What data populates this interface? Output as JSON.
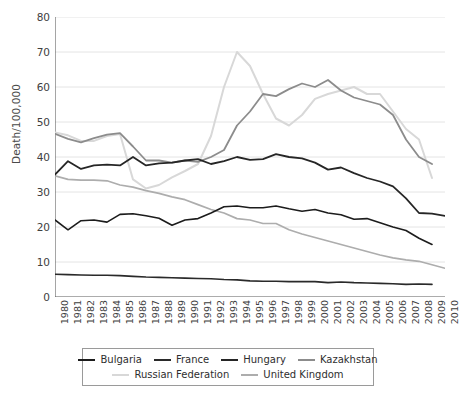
{
  "chart_data": {
    "type": "line",
    "title": "",
    "xlabel": "",
    "ylabel": "Death/100,000",
    "ylim": [
      0,
      80
    ],
    "ytick_step": 10,
    "grid": true,
    "legend_position": "bottom",
    "yticks": [
      "0",
      "10",
      "20",
      "30",
      "40",
      "50",
      "60",
      "70",
      "80"
    ],
    "x": [
      "1980",
      "1981",
      "1982",
      "1983",
      "1984",
      "1985",
      "1986",
      "1987",
      "1988",
      "1989",
      "1990",
      "1991",
      "1992",
      "1993",
      "1994",
      "1995",
      "1996",
      "1997",
      "1998",
      "1999",
      "2000",
      "2001",
      "2002",
      "2003",
      "2004",
      "2005",
      "2006",
      "2007",
      "2008",
      "2009",
      "2010"
    ],
    "series": [
      {
        "name": "Bulgaria",
        "color": "#1c1c1c",
        "width": 1.6,
        "values": [
          22.0,
          19.2,
          21.8,
          22.0,
          21.4,
          23.6,
          23.8,
          23.2,
          22.5,
          20.5,
          22.0,
          22.4,
          24.0,
          25.8,
          26.0,
          25.5,
          25.5,
          26.0,
          25.2,
          24.5,
          25.0,
          24.0,
          23.5,
          22.2,
          22.4,
          21.2,
          20.0,
          19.0,
          16.8,
          15.0,
          null
        ]
      },
      {
        "name": "France",
        "color": "#2a2a2a",
        "width": 1.6,
        "values": [
          6.5,
          6.4,
          6.3,
          6.2,
          6.2,
          6.1,
          5.9,
          5.7,
          5.6,
          5.5,
          5.4,
          5.3,
          5.2,
          5.0,
          4.9,
          4.6,
          4.5,
          4.5,
          4.4,
          4.4,
          4.4,
          4.1,
          4.3,
          4.1,
          4.0,
          3.9,
          3.8,
          3.6,
          3.7,
          3.6,
          null
        ]
      },
      {
        "name": "Hungary",
        "color": "#262626",
        "width": 1.8,
        "values": [
          35.0,
          38.8,
          36.6,
          37.6,
          37.8,
          37.6,
          40.0,
          37.6,
          38.2,
          38.4,
          39.0,
          39.4,
          38.0,
          38.8,
          40.0,
          39.2,
          39.4,
          40.8,
          40.0,
          39.6,
          38.4,
          36.4,
          37.0,
          35.4,
          34.0,
          33.0,
          31.6,
          28.2,
          24.0,
          23.8,
          23.2
        ]
      },
      {
        "name": "Kazakhstan",
        "color": "#8c8c8c",
        "width": 1.8,
        "values": [
          46.6,
          45.2,
          44.2,
          45.4,
          46.4,
          46.8,
          43.0,
          39.0,
          39.0,
          38.4,
          39.0,
          38.6,
          40.0,
          42.0,
          49.0,
          53.0,
          58.0,
          57.4,
          59.4,
          61.0,
          60.0,
          62.0,
          59.0,
          57.0,
          56.0,
          55.0,
          52.0,
          45.0,
          40.0,
          38.0,
          null
        ]
      },
      {
        "name": "Russian Federation",
        "color": "#d8d8d8",
        "width": 2.0,
        "values": [
          47.0,
          46.2,
          44.6,
          44.6,
          46.0,
          46.6,
          33.6,
          31.0,
          32.0,
          34.2,
          36.0,
          38.0,
          46.0,
          60.0,
          70.0,
          66.0,
          58.0,
          51.0,
          49.0,
          52.0,
          56.6,
          58.0,
          59.0,
          60.0,
          58.0,
          58.0,
          53.0,
          48.0,
          45.0,
          34.0,
          null
        ]
      },
      {
        "name": "United Kingdom",
        "color": "#adadad",
        "width": 1.7,
        "values": [
          34.6,
          33.6,
          33.4,
          33.4,
          33.2,
          32.0,
          31.4,
          30.4,
          29.6,
          28.6,
          27.8,
          26.4,
          25.0,
          24.0,
          22.4,
          22.0,
          21.0,
          21.0,
          19.2,
          18.0,
          17.0,
          16.0,
          15.0,
          14.0,
          13.0,
          12.0,
          11.2,
          10.6,
          10.2,
          9.2,
          8.2
        ]
      }
    ],
    "legend": {
      "rows": [
        [
          "Bulgaria",
          "France",
          "Hungary",
          "Kazakhstan"
        ],
        [
          "Russian Federation",
          "United Kingdom"
        ]
      ]
    }
  },
  "axes": {
    "y_title": "Death/100,000"
  },
  "style": {
    "grid_color": "#e4e4e4",
    "axis_color": "#5a5a5a",
    "background": "#ffffff"
  }
}
